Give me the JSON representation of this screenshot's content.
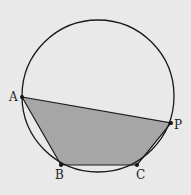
{
  "diagram": {
    "background": "#e9e9e9",
    "stroke_color": "#1a1a1a",
    "fill_color": "#a6a6a6",
    "circle": {
      "cx": 98,
      "cy": 96,
      "r": 76
    },
    "points": {
      "A": {
        "label": "A",
        "x": 22,
        "y": 97
      },
      "B": {
        "label": "B",
        "x": 61,
        "y": 165
      },
      "C": {
        "label": "C",
        "x": 137,
        "y": 165
      },
      "P": {
        "label": "P",
        "x": 171,
        "y": 123
      }
    },
    "polygon_order": [
      "A",
      "B",
      "C",
      "P"
    ]
  }
}
